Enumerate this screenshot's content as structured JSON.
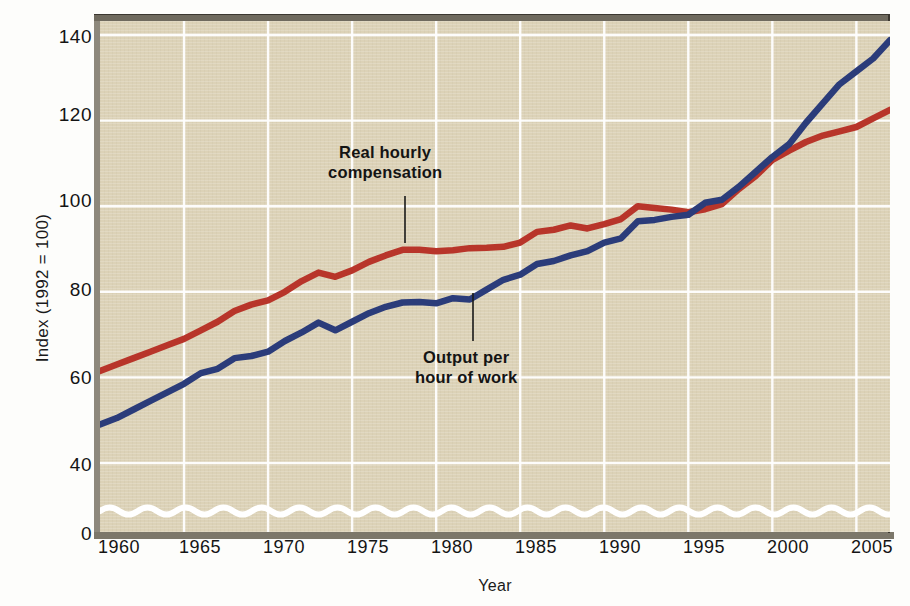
{
  "chart_data": {
    "type": "line",
    "title": "",
    "xlabel": "Year",
    "ylabel": "Index (1992 = 100)",
    "xlim": [
      1960,
      2007
    ],
    "ylim": [
      30,
      145
    ],
    "ytick_values": [
      40,
      60,
      80,
      100,
      120,
      140
    ],
    "ytick_labels": [
      "40",
      "60",
      "80",
      "100",
      "120",
      "140"
    ],
    "y_zero_label": "0",
    "xtick_values": [
      1960,
      1965,
      1970,
      1975,
      1980,
      1985,
      1990,
      1995,
      2000,
      2005
    ],
    "xtick_labels": [
      "1960",
      "1965",
      "1970",
      "1975",
      "1980",
      "1985",
      "1990",
      "1995",
      "2000",
      "2005"
    ],
    "grid": true,
    "axis_break": true,
    "legend": "annotations",
    "background_color": "#dcd2b7",
    "grid_color": "#ffffff",
    "series": [
      {
        "name": "Real hourly compensation",
        "color": "#b8352a",
        "x": [
          1960,
          1961,
          1962,
          1963,
          1964,
          1965,
          1966,
          1967,
          1968,
          1969,
          1970,
          1971,
          1972,
          1973,
          1974,
          1975,
          1976,
          1977,
          1978,
          1979,
          1980,
          1981,
          1982,
          1983,
          1984,
          1985,
          1986,
          1987,
          1988,
          1989,
          1990,
          1991,
          1992,
          1993,
          1994,
          1995,
          1996,
          1997,
          1998,
          1999,
          2000,
          2001,
          2002,
          2003,
          2004,
          2005,
          2006,
          2007
        ],
        "values": [
          61.5,
          63.0,
          64.5,
          66.0,
          67.5,
          69.0,
          71.0,
          73.0,
          75.5,
          77.0,
          78.0,
          80.0,
          82.5,
          84.5,
          83.5,
          85.0,
          87.0,
          88.5,
          89.8,
          89.8,
          89.5,
          89.7,
          90.2,
          90.3,
          90.5,
          91.5,
          94.0,
          94.5,
          95.5,
          94.8,
          95.8,
          97.0,
          100.0,
          99.6,
          99.2,
          98.6,
          99.3,
          100.5,
          104.0,
          107.0,
          110.8,
          113.0,
          115.0,
          116.5,
          117.5,
          118.5,
          120.5,
          122.5
        ]
      },
      {
        "name": "Output per hour of work",
        "color": "#2b3c7a",
        "x": [
          1960,
          1961,
          1962,
          1963,
          1964,
          1965,
          1966,
          1967,
          1968,
          1969,
          1970,
          1971,
          1972,
          1973,
          1974,
          1975,
          1976,
          1977,
          1978,
          1979,
          1980,
          1981,
          1982,
          1983,
          1984,
          1985,
          1986,
          1987,
          1988,
          1989,
          1990,
          1991,
          1992,
          1993,
          1994,
          1995,
          1996,
          1997,
          1998,
          1999,
          2000,
          2001,
          2002,
          2003,
          2004,
          2005,
          2006,
          2007
        ],
        "values": [
          49.0,
          50.5,
          52.5,
          54.5,
          56.5,
          58.5,
          61.0,
          62.0,
          64.5,
          65.0,
          66.0,
          68.5,
          70.5,
          72.8,
          71.0,
          73.0,
          75.0,
          76.5,
          77.5,
          77.6,
          77.3,
          78.5,
          78.2,
          80.5,
          82.8,
          84.0,
          86.5,
          87.2,
          88.5,
          89.5,
          91.5,
          92.5,
          96.5,
          96.8,
          97.5,
          98.0,
          100.8,
          101.5,
          104.5,
          108.0,
          111.5,
          114.5,
          119.5,
          124.0,
          128.5,
          131.5,
          134.5,
          138.8
        ]
      }
    ],
    "annotations": [
      {
        "id": "compensation",
        "line1": "Real hourly",
        "line2": "compensation",
        "leader_from_x": 405,
        "leader_from_y": 196,
        "leader_to_y": 243
      },
      {
        "id": "output",
        "line1": "Output per",
        "line2": "hour of work",
        "leader_from_x": 473,
        "leader_from_y": 293,
        "leader_to_y": 341
      }
    ]
  }
}
